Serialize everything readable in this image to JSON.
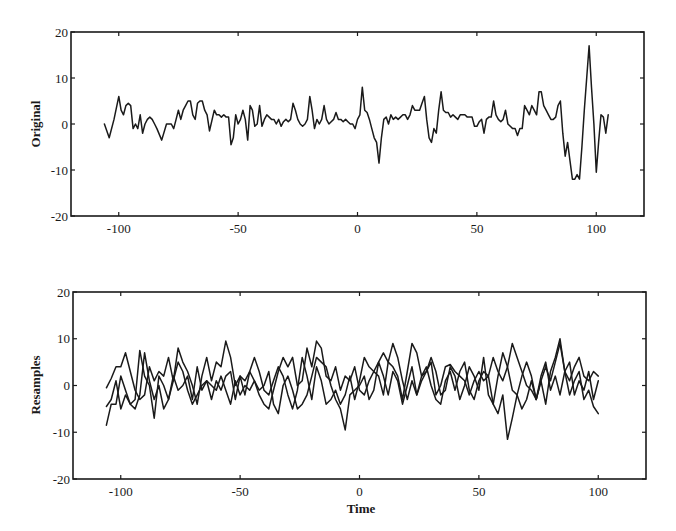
{
  "chart_data": [
    {
      "type": "line",
      "title": "",
      "xlabel": "",
      "ylabel": "Original",
      "xlim": [
        -120,
        120
      ],
      "ylim": [
        -20,
        20
      ],
      "xticks": [
        -100,
        -50,
        0,
        50,
        100
      ],
      "xtick_labels": [
        "-100",
        "-50",
        "0",
        "50",
        "100"
      ],
      "yticks": [
        -20,
        -10,
        0,
        10,
        20
      ],
      "ytick_labels": [
        "-20",
        "-10",
        "0",
        "10",
        "20"
      ],
      "grid": false,
      "legend": null,
      "series": [
        {
          "name": "Original",
          "x": [
            -106,
            -104,
            -102,
            -100,
            -99,
            -98,
            -97,
            -96,
            -95,
            -94,
            -93,
            -92,
            -91,
            -90,
            -89,
            -88,
            -87,
            -86,
            -85,
            -84,
            -82,
            -80,
            -78,
            -77,
            -76,
            -75,
            -74,
            -73,
            -72,
            -71,
            -70,
            -69,
            -68,
            -67,
            -66,
            -65,
            -64,
            -63,
            -62,
            -60,
            -59,
            -58,
            -57,
            -56,
            -55,
            -54,
            -53,
            -52,
            -51,
            -50,
            -49,
            -48,
            -47,
            -46,
            -45,
            -44,
            -43,
            -42,
            -41,
            -40,
            -39,
            -38,
            -37,
            -36,
            -35,
            -34,
            -33,
            -32,
            -31,
            -30,
            -29,
            -28,
            -27,
            -26,
            -25,
            -24,
            -23,
            -22,
            -21,
            -20,
            -19,
            -18,
            -17,
            -16,
            -15,
            -14,
            -13,
            -12,
            -11,
            -10,
            -9,
            -8,
            -7,
            -6,
            -5,
            -4,
            -3,
            -2,
            -1,
            0,
            1,
            2,
            3,
            4,
            5,
            6,
            7,
            8,
            9,
            10,
            11,
            12,
            13,
            14,
            15,
            16,
            17,
            18,
            19,
            20,
            21,
            22,
            23,
            24,
            25,
            26,
            27,
            28,
            29,
            30,
            31,
            32,
            33,
            34,
            35,
            36,
            37,
            38,
            39,
            40,
            41,
            42,
            43,
            44,
            45,
            46,
            47,
            48,
            49,
            50,
            51,
            52,
            53,
            54,
            55,
            56,
            57,
            58,
            59,
            60,
            61,
            62,
            63,
            64,
            65,
            66,
            67,
            68,
            69,
            70,
            71,
            72,
            73,
            74,
            75,
            76,
            77,
            78,
            79,
            80,
            81,
            82,
            83,
            84,
            85,
            86,
            87,
            88,
            89,
            90,
            91,
            92,
            93,
            94,
            95,
            96,
            97,
            98,
            99,
            100,
            101,
            102,
            103,
            104,
            105,
            106,
            107
          ],
          "y": [
            0,
            -3,
            1,
            6,
            3,
            2,
            4,
            4.5,
            4,
            -1,
            0,
            -1,
            2,
            -2,
            0,
            1,
            1.5,
            1,
            0,
            -1,
            -3.5,
            0,
            0,
            -1,
            1,
            3,
            1,
            3,
            4,
            5,
            5,
            2,
            1,
            4.5,
            5,
            5,
            3,
            2,
            -1.5,
            3,
            2,
            2,
            1.5,
            2,
            1.5,
            1.5,
            -4.5,
            -3,
            2,
            0,
            1,
            3,
            1,
            -3.5,
            4,
            3,
            -0.5,
            0,
            4,
            -0.5,
            1,
            2,
            1.5,
            1,
            1,
            0,
            1,
            -0.5,
            0.5,
            1,
            0.5,
            1,
            4.5,
            3,
            1,
            0,
            -0.5,
            0,
            1,
            6,
            3,
            -1,
            1,
            0,
            1,
            4,
            1,
            0,
            0.5,
            1,
            2.5,
            1,
            1,
            0.5,
            1,
            0.5,
            0,
            0,
            -1,
            1,
            2,
            8,
            3,
            2.5,
            1,
            -1,
            -3,
            -4,
            -8.5,
            -3,
            1,
            1.5,
            0,
            2,
            1,
            1.5,
            1,
            1.5,
            2,
            2,
            1,
            2,
            4,
            3,
            3,
            3,
            4.5,
            6,
            1,
            -3,
            -4,
            -1,
            -2,
            3,
            7,
            3,
            2.5,
            2.5,
            1.5,
            2,
            1.5,
            1,
            2,
            2,
            2,
            1.5,
            1.5,
            1.5,
            -0.5,
            -0.5,
            0.5,
            1,
            -2,
            1,
            1.5,
            1.5,
            5,
            2,
            1,
            0.5,
            1,
            3,
            0,
            -0.5,
            -1,
            -1,
            -2.5,
            -1,
            -1,
            4,
            3,
            2,
            4,
            3,
            2,
            7,
            7,
            4,
            3,
            2,
            1,
            1,
            1.5,
            4,
            5,
            -2,
            -7,
            -4,
            -8,
            -12,
            -12,
            -11,
            -12,
            -5,
            3,
            10,
            17,
            8,
            0,
            -10.5,
            -4,
            2,
            1.5,
            -2,
            2
          ]
        }
      ]
    },
    {
      "type": "line",
      "title": "",
      "xlabel": "Time",
      "ylabel": "Resamples",
      "xlim": [
        -120,
        120
      ],
      "ylim": [
        -20,
        20
      ],
      "xticks": [
        -100,
        -50,
        0,
        50,
        100
      ],
      "xtick_labels": [
        "-100",
        "-50",
        "0",
        "50",
        "100"
      ],
      "yticks": [
        -20,
        -10,
        0,
        10,
        20
      ],
      "ytick_labels": [
        "-20",
        "-10",
        "0",
        "10",
        "20"
      ],
      "grid": false,
      "legend": null,
      "series": [
        {
          "name": "Resample 1",
          "x": [
            -106,
            -104,
            -102,
            -100,
            -98,
            -96,
            -94,
            -92,
            -90,
            -88,
            -86,
            -84,
            -82,
            -80,
            -78,
            -76,
            -74,
            -72,
            -70,
            -68,
            -66,
            -64,
            -62,
            -60,
            -58,
            -56,
            -54,
            -52,
            -50,
            -48,
            -46,
            -44,
            -42,
            -40,
            -38,
            -36,
            -34,
            -32,
            -30,
            -28,
            -26,
            -24,
            -22,
            -20,
            -18,
            -16,
            -14,
            -12,
            -10,
            -8,
            -6,
            -4,
            -2,
            0,
            2,
            4,
            6,
            8,
            10,
            12,
            14,
            16,
            18,
            20,
            22,
            24,
            26,
            28,
            30,
            32,
            34,
            36,
            38,
            40,
            42,
            44,
            46,
            48,
            50,
            52,
            54,
            56,
            58,
            60,
            62,
            64,
            66,
            68,
            70,
            72,
            74,
            76,
            78,
            80,
            82,
            84,
            86,
            88,
            90,
            92,
            94,
            96,
            98,
            100,
            102,
            104,
            106,
            107
          ],
          "y": [
            -0.5,
            1.5,
            4,
            4,
            7,
            3,
            -1,
            -3,
            -2,
            4,
            1,
            3,
            2,
            6,
            1,
            8,
            5,
            3,
            0,
            -4,
            2,
            6,
            1,
            5,
            4,
            9.5,
            6,
            0,
            2,
            1,
            3,
            1,
            -2,
            -4,
            -5,
            -1,
            3,
            6,
            4,
            6,
            0,
            1,
            8,
            4,
            9.5,
            8,
            2,
            1,
            4,
            -1,
            2,
            1,
            4,
            -1,
            -2,
            1,
            3,
            5,
            7,
            5,
            4,
            2,
            -3,
            3,
            9,
            7,
            2,
            3,
            5,
            -2,
            0,
            4,
            4.5,
            3,
            2,
            1,
            -2,
            1,
            3,
            1,
            2,
            6,
            3,
            1,
            4,
            9,
            6,
            3,
            0,
            -1,
            -3,
            1,
            4,
            1,
            5,
            9,
            3,
            1,
            4,
            6,
            2,
            1,
            3,
            2
          ]
        },
        {
          "name": "Resample 2",
          "x": [
            -106,
            -104,
            -102,
            -100,
            -98,
            -96,
            -94,
            -92,
            -90,
            -88,
            -86,
            -84,
            -82,
            -80,
            -78,
            -76,
            -74,
            -72,
            -70,
            -68,
            -66,
            -64,
            -62,
            -60,
            -58,
            -56,
            -54,
            -52,
            -50,
            -48,
            -46,
            -44,
            -42,
            -40,
            -38,
            -36,
            -34,
            -32,
            -30,
            -28,
            -26,
            -24,
            -22,
            -20,
            -18,
            -16,
            -14,
            -12,
            -10,
            -8,
            -6,
            -4,
            -2,
            0,
            2,
            4,
            6,
            8,
            10,
            12,
            14,
            16,
            18,
            20,
            22,
            24,
            26,
            28,
            30,
            32,
            34,
            36,
            38,
            40,
            42,
            44,
            46,
            48,
            50,
            52,
            54,
            56,
            58,
            60,
            62,
            64,
            66,
            68,
            70,
            72,
            74,
            76,
            78,
            80,
            82,
            84,
            86,
            88,
            90,
            92,
            94,
            96,
            98,
            100,
            102,
            104,
            106,
            107
          ],
          "y": [
            -8.5,
            -4,
            -4,
            2,
            -1,
            -4,
            -5,
            -2,
            7,
            1,
            -3,
            0,
            -5,
            -3,
            1,
            5,
            3,
            -1,
            -4,
            -2,
            0,
            1,
            -3,
            1,
            -1,
            2,
            3,
            -3,
            2,
            -2,
            3,
            6,
            3,
            -1,
            -2,
            1,
            4,
            2,
            -2,
            -5,
            -1,
            6,
            2,
            -3,
            4,
            1,
            -4,
            -3,
            -1,
            -4,
            -2,
            2,
            -3,
            1,
            6,
            4,
            3,
            2,
            -2,
            5,
            9,
            6,
            1,
            -3,
            1,
            -2,
            2,
            4,
            0,
            -3,
            -4,
            1,
            3,
            -1,
            3,
            5,
            -1,
            -3,
            1,
            3,
            2,
            -4,
            -6,
            -2,
            -11.5,
            -7,
            -2,
            2,
            5,
            2,
            -3,
            1,
            -4,
            3,
            6,
            10,
            3,
            -2,
            1,
            3,
            -3,
            -1,
            -4.5,
            -6
          ]
        },
        {
          "name": "Resample 3",
          "x": [
            -106,
            -104,
            -102,
            -100,
            -98,
            -96,
            -94,
            -92,
            -90,
            -88,
            -86,
            -84,
            -82,
            -80,
            -78,
            -76,
            -74,
            -72,
            -70,
            -68,
            -66,
            -64,
            -62,
            -60,
            -58,
            -56,
            -54,
            -52,
            -50,
            -48,
            -46,
            -44,
            -42,
            -40,
            -38,
            -36,
            -34,
            -32,
            -30,
            -28,
            -26,
            -24,
            -22,
            -20,
            -18,
            -16,
            -14,
            -12,
            -10,
            -8,
            -6,
            -4,
            -2,
            0,
            2,
            4,
            6,
            8,
            10,
            12,
            14,
            16,
            18,
            20,
            22,
            24,
            26,
            28,
            30,
            32,
            34,
            36,
            38,
            40,
            42,
            44,
            46,
            48,
            50,
            52,
            54,
            56,
            58,
            60,
            62,
            64,
            66,
            68,
            70,
            72,
            74,
            76,
            78,
            80,
            82,
            84,
            86,
            88,
            90,
            92,
            94,
            96,
            98,
            100,
            102,
            104,
            106,
            107
          ],
          "y": [
            -4.5,
            -3,
            1,
            -5,
            -2,
            -4,
            -3,
            7.5,
            2,
            0,
            -7,
            2,
            0,
            -3,
            2,
            -1,
            0,
            2,
            -3,
            4,
            -1,
            1,
            0,
            -1,
            2,
            -1,
            -4,
            1,
            -2,
            0,
            -1,
            1,
            -1,
            0,
            3,
            -4,
            -6,
            0,
            2,
            -1,
            -5,
            -4,
            -2,
            2,
            6,
            5,
            4,
            0,
            -3,
            -5,
            -9.5,
            -2,
            -1,
            0,
            2,
            -3,
            -1,
            5,
            2,
            -2,
            3,
            1,
            -4,
            0,
            4,
            -2,
            1,
            3,
            6,
            3,
            -2,
            -1,
            4,
            2,
            -3,
            0,
            4,
            2,
            -1,
            6,
            -2,
            -4,
            2,
            7,
            4,
            -1,
            -2,
            -5,
            -3,
            1,
            -3,
            2,
            5,
            -1,
            2,
            -2,
            3,
            5,
            -2,
            1,
            -1,
            3,
            -3,
            1
          ]
        }
      ]
    }
  ]
}
